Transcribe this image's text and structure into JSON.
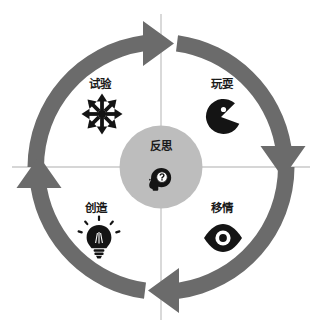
{
  "diagram": {
    "colors": {
      "arrow_gray": "#6b6b6b",
      "center_circle_gray": "#bdbdbd",
      "divider_line": "#c9c9c9",
      "icon_black": "#141414",
      "background": "#ffffff",
      "text": "#1a1a1a"
    },
    "center": {
      "label": "反思",
      "icon": "head-question-mark-icon"
    },
    "quadrants": [
      {
        "key": "experiment",
        "label": "试验",
        "icon": "snowflake-expand-arrows-icon",
        "position": "top-left"
      },
      {
        "key": "play",
        "label": "玩耍",
        "icon": "pacman-icon",
        "position": "top-right"
      },
      {
        "key": "create",
        "label": "创造",
        "icon": "lightbulb-icon",
        "position": "bottom-left"
      },
      {
        "key": "empathy",
        "label": "移情",
        "icon": "eye-icon",
        "position": "bottom-right"
      }
    ],
    "arrows": [
      {
        "key": "top-arc",
        "direction": "clockwise",
        "head": "right",
        "icon": "curved-arrow-icon"
      },
      {
        "key": "right-arc",
        "direction": "clockwise",
        "head": "down",
        "icon": "curved-arrow-icon"
      },
      {
        "key": "bottom-arc",
        "direction": "clockwise",
        "head": "left",
        "icon": "curved-arrow-icon"
      },
      {
        "key": "left-arc",
        "direction": "clockwise",
        "head": "up",
        "icon": "curved-arrow-icon"
      }
    ]
  }
}
